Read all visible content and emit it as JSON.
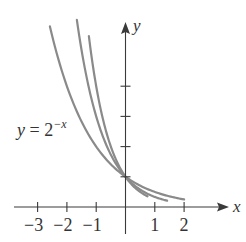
{
  "chart_data": {
    "type": "line",
    "title": "",
    "xlabel": "x",
    "ylabel": "y",
    "xlim": [
      -3.7,
      3.5
    ],
    "ylim": [
      -0.8,
      6.2
    ],
    "grid": false,
    "x_ticks": [
      -3,
      -2,
      -1,
      1,
      2
    ],
    "x_tick_labels": [
      "−3",
      "−2",
      "−1",
      "1",
      "2"
    ],
    "y_ticks": [
      1,
      2,
      3,
      4
    ],
    "y_tick_labels": [],
    "series": [
      {
        "name": "y = 2^(−x)",
        "base": 2,
        "x_range": [
          -2.58,
          2.0
        ],
        "color": "#8a8a8a"
      },
      {
        "name": "y = 3^(−x)",
        "base": 3,
        "x_range": [
          -1.66,
          1.42
        ],
        "color": "#8a8a8a"
      },
      {
        "name": "y = 4^(−x)",
        "base": 4,
        "x_range": [
          -1.25,
          0.75
        ],
        "color": "#8a8a8a"
      }
    ],
    "annotations": [
      {
        "text_main": "y = 2",
        "text_sup": "−x",
        "points_to": "y = 2^(−x)"
      }
    ],
    "legend": "none"
  },
  "labels": {
    "x_axis": "x",
    "y_axis": "y",
    "curve_label_main": "y = 2",
    "curve_label_sup": "−x"
  }
}
